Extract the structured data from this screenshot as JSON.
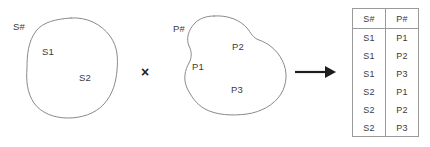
{
  "diagram": {
    "operator": "×",
    "arrow": "right-arrow",
    "stroke_color": "#8a8a8a",
    "text_color": "#3b3b3b",
    "ink_color": "#1d1d1d",
    "background_color": "#ffffff"
  },
  "set_s": {
    "label": "S#",
    "members": [
      {
        "label": "S1"
      },
      {
        "label": "S2"
      }
    ]
  },
  "set_p": {
    "label": "P#",
    "members": [
      {
        "label": "P1"
      },
      {
        "label": "P2"
      },
      {
        "label": "P3"
      }
    ]
  },
  "result_table": {
    "columns": [
      "S#",
      "P#"
    ],
    "rows": [
      [
        "S1",
        "P1"
      ],
      [
        "S1",
        "P2"
      ],
      [
        "S1",
        "P3"
      ],
      [
        "S2",
        "P1"
      ],
      [
        "S2",
        "P2"
      ],
      [
        "S2",
        "P3"
      ]
    ]
  }
}
